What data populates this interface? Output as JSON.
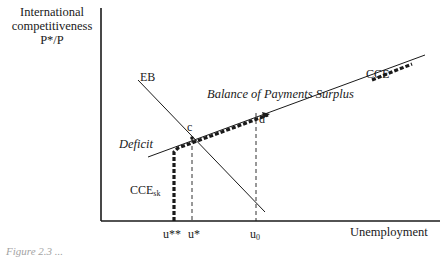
{
  "figure": {
    "y_axis_label_lines": [
      "International",
      "competitiveness",
      "P*/P"
    ],
    "x_axis_label": "Unemployment",
    "curve_labels": {
      "eb": "EB",
      "cce": "CCE",
      "cce_sk_base": "CCE",
      "cce_sk_sub": "sk",
      "deficit": "Deficit",
      "surplus": "Balance of Payments Surplus",
      "point_c": "c",
      "point_d": "d"
    },
    "x_ticks": {
      "u_double_star": "u**",
      "u_star": "u*",
      "u0_base": "u",
      "u0_sub": "0"
    },
    "caption": "Figure 2.3   ..."
  },
  "colors": {
    "ink": "#1a1a1a",
    "background": "#ffffff"
  }
}
